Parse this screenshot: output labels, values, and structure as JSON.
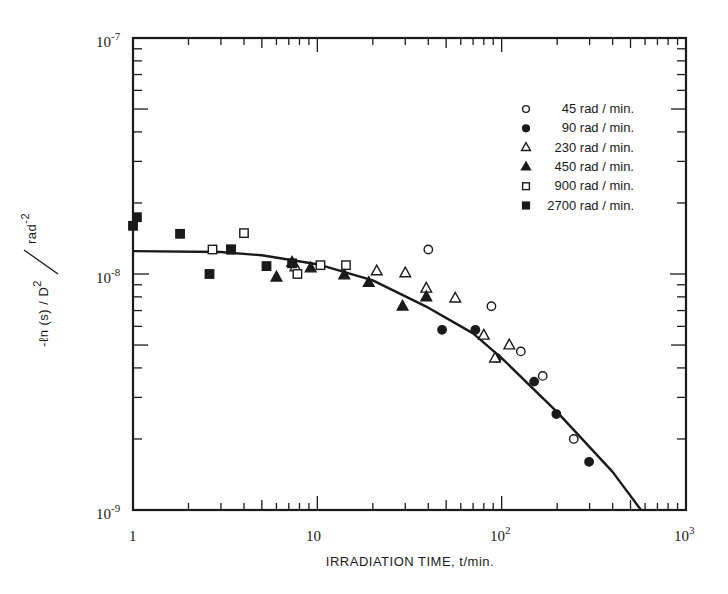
{
  "chart_data": {
    "type": "scatter",
    "title": "",
    "xlabel": "IRRADIATION TIME, t/min.",
    "ylabel": "-ln(s)/D^2 / rad^-2",
    "xscale": "log",
    "yscale": "log",
    "xlim": [
      1,
      1000
    ],
    "ylim": [
      1e-09,
      1e-07
    ],
    "x_tick_labels": [
      "1",
      "10",
      "10^2",
      "10^3"
    ],
    "y_tick_labels": [
      "10^-9",
      "10^-8",
      "10^-7"
    ],
    "grid": false,
    "legend_position": "upper right inside",
    "series": [
      {
        "name": "45 rad/min.",
        "marker": "open-circle",
        "x": [
          40,
          88,
          127,
          167,
          246
        ],
        "y": [
          1.27e-08,
          7.3e-09,
          4.7e-09,
          3.7e-09,
          2e-09
        ]
      },
      {
        "name": "90 rad/min.",
        "marker": "filled-circle",
        "x": [
          47.5,
          72,
          94,
          150,
          198,
          298
        ],
        "y": [
          5.8e-09,
          5.8e-09,
          4.4e-09,
          3.5e-09,
          2.55e-09,
          1.6e-09
        ]
      },
      {
        "name": "230 rad/min.",
        "marker": "open-triangle",
        "x": [
          7.6,
          21,
          30,
          39,
          56,
          80,
          92,
          110
        ],
        "y": [
          1.07e-08,
          1.03e-08,
          1.01e-08,
          8.7e-09,
          7.9e-09,
          5.5e-09,
          4.4e-09,
          5e-09
        ]
      },
      {
        "name": "450 rad/min.",
        "marker": "filled-triangle",
        "x": [
          6.0,
          7.3,
          9.2,
          14,
          19,
          29,
          39
        ],
        "y": [
          9.7e-09,
          1.12e-08,
          1.06e-08,
          9.9e-09,
          9.2e-09,
          7.3e-09,
          8e-09
        ]
      },
      {
        "name": "900 rad/min.",
        "marker": "open-square",
        "x": [
          2.7,
          4.0,
          3.4,
          7.8,
          10.4,
          14.3
        ],
        "y": [
          1.27e-08,
          1.49e-08,
          1.27e-08,
          1e-08,
          1.09e-08,
          1.09e-08
        ]
      },
      {
        "name": "2700 rad/min.",
        "marker": "filled-square",
        "x": [
          1.0,
          1.05,
          1.8,
          2.6,
          3.4,
          5.3,
          7.3
        ],
        "y": [
          1.6e-08,
          1.74e-08,
          1.48e-08,
          1e-08,
          1.27e-08,
          1.08e-08,
          1.11e-08
        ]
      }
    ],
    "fit_curve": {
      "description": "solid fitted line, flat near 1.25e-8 at short times, curving down to ~1e-9 near t≈570 min",
      "x": [
        1,
        3,
        5,
        10,
        20,
        40,
        70,
        100,
        200,
        400,
        570
      ],
      "y": [
        1.25e-08,
        1.24e-08,
        1.2e-08,
        1.1e-08,
        9.4e-09,
        7.2e-09,
        5.6e-09,
        4.4e-09,
        2.6e-09,
        1.45e-09,
        1e-09
      ]
    }
  },
  "axes": {
    "x_title": "IRRADIATION TIME, t/min.",
    "y_title_num": "-ℓn (s) / D",
    "y_title_den": "rad",
    "x_ticks": [
      {
        "base": "1",
        "exp": ""
      },
      {
        "base": "10",
        "exp": ""
      },
      {
        "base": "10",
        "exp": "2"
      },
      {
        "base": "10",
        "exp": "3"
      }
    ],
    "y_ticks": [
      {
        "base": "10",
        "exp": "-7"
      },
      {
        "base": "10",
        "exp": "-8"
      },
      {
        "base": "10",
        "exp": "-9"
      }
    ]
  },
  "legend": [
    {
      "label": "45 rad / min.",
      "marker": "open-circle"
    },
    {
      "label": "90 rad / min.",
      "marker": "filled-circle"
    },
    {
      "label": "230 rad / min.",
      "marker": "open-triangle"
    },
    {
      "label": "450 rad / min.",
      "marker": "filled-triangle"
    },
    {
      "label": "900 rad / min.",
      "marker": "open-square"
    },
    {
      "label": "2700 rad / min.",
      "marker": "filled-square"
    }
  ]
}
